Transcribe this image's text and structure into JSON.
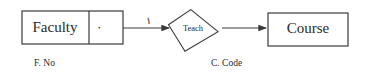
{
  "diagram": {
    "entities": {
      "faculty": {
        "label": "Faculty",
        "cardinality": "٠",
        "key_attribute": "F. No"
      },
      "course": {
        "label": "Course",
        "key_attribute": "C. Code"
      }
    },
    "relationship": {
      "label": "Teach"
    },
    "edges": [
      {
        "from": "Faculty",
        "to": "Teach",
        "label": "١"
      },
      {
        "from": "Teach",
        "to": "Course",
        "label": ""
      }
    ],
    "colors": {
      "stroke": "#3a3a3a",
      "text": "#2a2a2a",
      "background": "#ffffff"
    }
  }
}
